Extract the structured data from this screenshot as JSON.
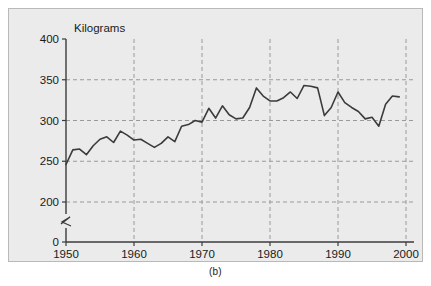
{
  "figure": {
    "caption": "(b)",
    "background_color": "#ebebeb",
    "frame_color": "#b9b9b9",
    "page_color": "#ffffff"
  },
  "chart_data": {
    "type": "line",
    "title": "",
    "subtitle": "",
    "xlabel": "",
    "ylabel": "Kilograms",
    "ylabel_position": "above-axis-top",
    "xlim": [
      1950,
      2000
    ],
    "ylim": [
      0,
      400
    ],
    "y_axis_break": {
      "present": true,
      "between": [
        0,
        200
      ],
      "symbol": "zigzag"
    },
    "grid": {
      "x": true,
      "y": true,
      "style": "dashed",
      "color": "#9a9a9a"
    },
    "legend": {
      "present": false,
      "position": "none"
    },
    "xticks": [
      1950,
      1960,
      1970,
      1980,
      1990,
      2000
    ],
    "xtick_labels": [
      "1950",
      "1960",
      "1970",
      "1980",
      "1990",
      "2000"
    ],
    "yticks": [
      0,
      200,
      250,
      300,
      350,
      400
    ],
    "ytick_labels": [
      "0",
      "200",
      "250",
      "300",
      "350",
      "400"
    ],
    "series": [
      {
        "name": "Kilograms",
        "color": "#3b3b3b",
        "line_width": 1.6,
        "x": [
          1950,
          1951,
          1952,
          1953,
          1954,
          1955,
          1956,
          1957,
          1958,
          1959,
          1960,
          1961,
          1962,
          1963,
          1964,
          1965,
          1966,
          1967,
          1968,
          1969,
          1970,
          1971,
          1972,
          1973,
          1974,
          1975,
          1976,
          1977,
          1978,
          1979,
          1980,
          1981,
          1982,
          1983,
          1984,
          1985,
          1986,
          1987,
          1988,
          1989,
          1990,
          1991,
          1992,
          1993,
          1994,
          1995,
          1996,
          1997,
          1998,
          1999
        ],
        "values": [
          246,
          264,
          265,
          258,
          269,
          277,
          280,
          273,
          287,
          282,
          276,
          277,
          272,
          267,
          272,
          280,
          274,
          293,
          295,
          300,
          298,
          315,
          303,
          318,
          307,
          302,
          303,
          316,
          340,
          330,
          324,
          324,
          328,
          335,
          327,
          343,
          342,
          340,
          306,
          316,
          335,
          322,
          316,
          311,
          302,
          304,
          293,
          320,
          330,
          329
        ]
      }
    ]
  }
}
